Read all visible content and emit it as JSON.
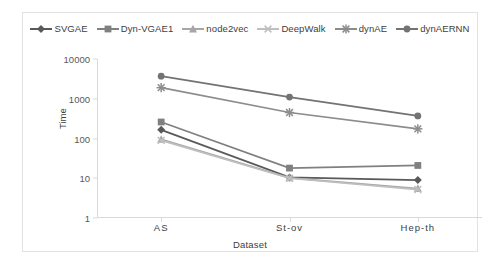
{
  "chart_data": {
    "type": "line",
    "title": "",
    "subtitle": "",
    "xlabel": "Dataset",
    "ylabel": "Time",
    "categories": [
      "AS",
      "St-ov",
      "Hep-th"
    ],
    "yscale": "log",
    "ylim": [
      1,
      10000
    ],
    "yticks": [
      1,
      10,
      100,
      1000,
      10000
    ],
    "ytick_labels": [
      "1",
      "10",
      "100",
      "1000",
      "10000"
    ],
    "grid": false,
    "legend_position": "top",
    "series": [
      {
        "name": "SVGAE",
        "marker": "diamond",
        "color": "#595959",
        "values": [
          165,
          10.5,
          9.0
        ]
      },
      {
        "name": "Dyn-VGAE1",
        "marker": "square",
        "color": "#808080",
        "values": [
          260,
          18,
          21
        ]
      },
      {
        "name": "node2vec",
        "marker": "triangle",
        "color": "#a6a6a6",
        "values": [
          95,
          10.2,
          5.5
        ]
      },
      {
        "name": "DeepWalk",
        "marker": "x",
        "color": "#bfbfbf",
        "values": [
          90,
          10.0,
          5.2
        ]
      },
      {
        "name": "dynAE",
        "marker": "star",
        "color": "#8c8c8c",
        "values": [
          1900,
          450,
          175
        ]
      },
      {
        "name": "dynAERNN",
        "marker": "circle",
        "color": "#737373",
        "values": [
          3700,
          1100,
          370
        ]
      }
    ]
  },
  "legend": {
    "items": [
      {
        "label": "SVGAE"
      },
      {
        "label": "Dyn-VGAE1"
      },
      {
        "label": "node2vec"
      },
      {
        "label": "DeepWalk"
      },
      {
        "label": "dynAE"
      },
      {
        "label": "dynAERNN"
      }
    ]
  },
  "axes": {
    "y_title": "Time",
    "x_title": "Dataset"
  }
}
